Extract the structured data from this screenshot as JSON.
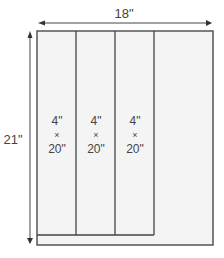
{
  "diagram": {
    "width_label": "18\"",
    "height_label": "21\"",
    "panels": [
      {
        "width": "4\"",
        "times": "×",
        "height": "20\""
      },
      {
        "width": "4\"",
        "times": "×",
        "height": "20\""
      },
      {
        "width": "4\"",
        "times": "×",
        "height": "20\""
      }
    ],
    "colors": {
      "outline": "#555555",
      "fill": "#f4f4f4",
      "text": "#444444"
    }
  }
}
